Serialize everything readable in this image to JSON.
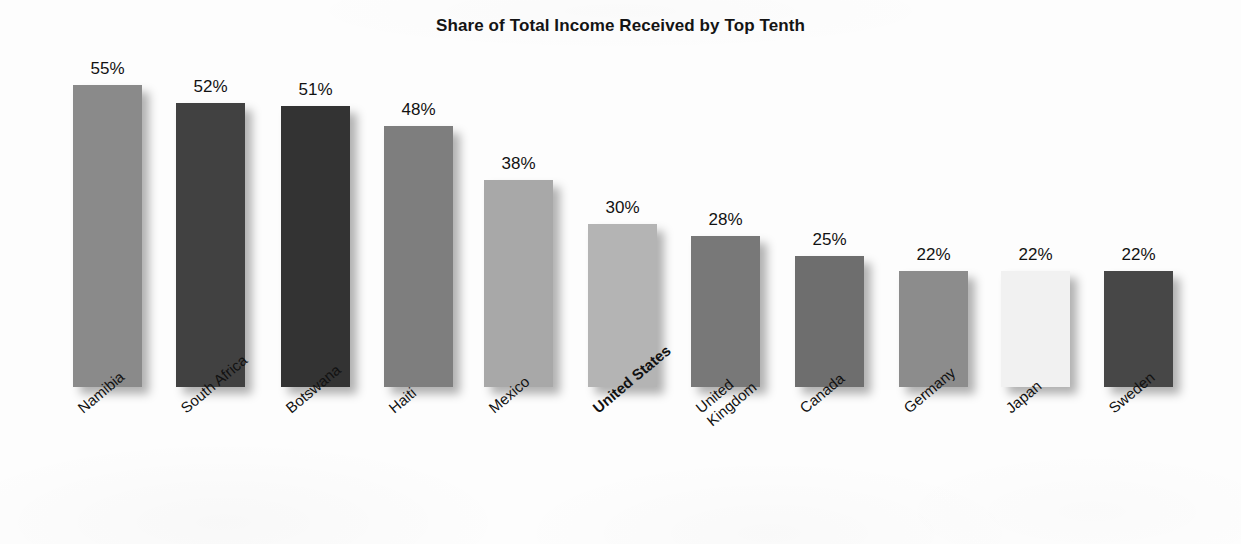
{
  "chart_data": {
    "type": "bar",
    "title": "Share of Total Income Received by Top Tenth",
    "xlabel": "",
    "ylabel": "",
    "ylim": [
      0,
      60
    ],
    "grid": false,
    "legend": "none",
    "value_suffix": "%",
    "categories": [
      "Namibia",
      "South Africa",
      "Botswana",
      "Haiti",
      "Mexico",
      "United States",
      "United Kingdom",
      "Canada",
      "Germany",
      "Japan",
      "Sweden"
    ],
    "values": [
      55,
      52,
      51,
      48,
      38,
      30,
      28,
      25,
      22,
      22,
      22
    ],
    "value_labels": [
      "55%",
      "52%",
      "51%",
      "48%",
      "38%",
      "30%",
      "28%",
      "25%",
      "22%",
      "22%",
      "22%"
    ],
    "highlighted_category": "United States",
    "bars": [
      {
        "label": "Namibia",
        "label_lines": [
          "Namibia"
        ],
        "value": 55,
        "value_label": "55%",
        "color": "#8a8a8a",
        "highlighted": false,
        "x": 73,
        "top": 85,
        "width": 69
      },
      {
        "label": "South Africa",
        "label_lines": [
          "South Africa"
        ],
        "value": 52,
        "value_label": "52%",
        "color": "#414141",
        "highlighted": false,
        "x": 176,
        "top": 103,
        "width": 69
      },
      {
        "label": "Botswana",
        "label_lines": [
          "Botswana"
        ],
        "value": 51,
        "value_label": "51%",
        "color": "#333333",
        "highlighted": false,
        "x": 281,
        "top": 106,
        "width": 69
      },
      {
        "label": "Haiti",
        "label_lines": [
          "Haiti"
        ],
        "value": 48,
        "value_label": "48%",
        "color": "#7e7e7e",
        "highlighted": false,
        "x": 384,
        "top": 126,
        "width": 69
      },
      {
        "label": "Mexico",
        "label_lines": [
          "Mexico"
        ],
        "value": 38,
        "value_label": "38%",
        "color": "#a8a8a8",
        "highlighted": false,
        "x": 484,
        "top": 180,
        "width": 69
      },
      {
        "label": "United States",
        "label_lines": [
          "United States"
        ],
        "value": 30,
        "value_label": "30%",
        "color": "#b4b4b4",
        "highlighted": true,
        "x": 588,
        "top": 224,
        "width": 69
      },
      {
        "label": "United Kingdom",
        "label_lines": [
          "United",
          "Kingdom"
        ],
        "value": 28,
        "value_label": "28%",
        "color": "#787878",
        "highlighted": false,
        "x": 691,
        "top": 236,
        "width": 69
      },
      {
        "label": "Canada",
        "label_lines": [
          "Canada"
        ],
        "value": 25,
        "value_label": "25%",
        "color": "#6e6e6e",
        "highlighted": false,
        "x": 795,
        "top": 256,
        "width": 69
      },
      {
        "label": "Germany",
        "label_lines": [
          "Germany"
        ],
        "value": 22,
        "value_label": "22%",
        "color": "#8c8c8c",
        "highlighted": false,
        "x": 899,
        "top": 271,
        "width": 69
      },
      {
        "label": "Japan",
        "label_lines": [
          "Japan"
        ],
        "value": 22,
        "value_label": "22%",
        "color": "#f1f1f1",
        "highlighted": false,
        "x": 1001,
        "top": 271,
        "width": 69
      },
      {
        "label": "Sweden",
        "label_lines": [
          "Sweden"
        ],
        "value": 22,
        "value_label": "22%",
        "color": "#474747",
        "highlighted": false,
        "x": 1104,
        "top": 271,
        "width": 69
      }
    ]
  }
}
